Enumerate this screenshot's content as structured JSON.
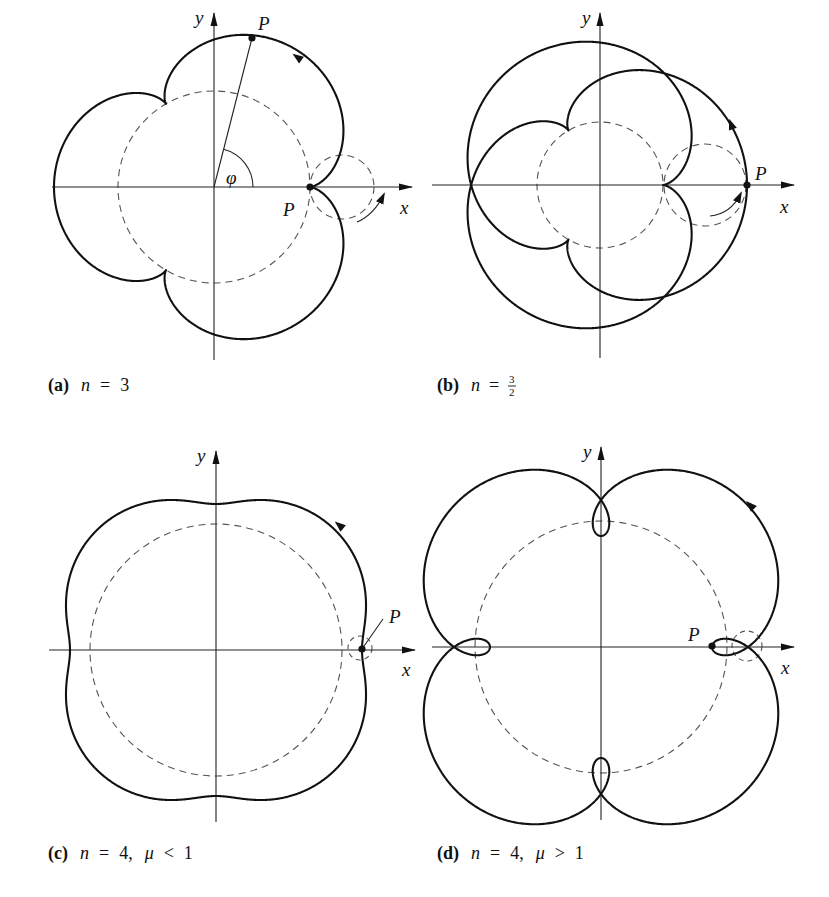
{
  "figure": {
    "width": 829,
    "height": 897,
    "colors": {
      "curve": "#111111",
      "axis": "#222222",
      "dashed": "#555555",
      "background": "#ffffff"
    }
  },
  "panels": [
    {
      "id": "a",
      "caption": {
        "tag": "(a)",
        "math": "n = 3",
        "n_label": "n",
        "eq": "=",
        "value": "3",
        "x": 48,
        "y": 391
      },
      "origin": [
        214,
        187
      ],
      "axes": {
        "x_from": 52,
        "x_to": 412,
        "y_from": 360,
        "y_to": 13,
        "x_label": "x",
        "y_label": "y",
        "x_label_pos": [
          400,
          214
        ],
        "y_label_pos": [
          195,
          24
        ]
      },
      "curve": {
        "type": "epicycloid",
        "R": 96,
        "r": 32,
        "d": 32,
        "turns": 1
      },
      "base_circle": {
        "r": 96
      },
      "rolling_circle": {
        "cx": 342,
        "cy": 187,
        "r": 32
      },
      "points": [
        {
          "label": "P",
          "x": 252,
          "y": 38,
          "label_pos": [
            258,
            30
          ]
        },
        {
          "label": "P",
          "x": 310,
          "y": 187,
          "label_pos": [
            283,
            216
          ]
        }
      ],
      "radius_line": {
        "from": [
          214,
          187
        ],
        "to": [
          252,
          38
        ]
      },
      "angle": {
        "label": "φ",
        "r": 39,
        "label_pos": [
          226,
          184
        ]
      },
      "direction_arrow": {
        "x": 297,
        "y": 57,
        "angle_deg": 215
      },
      "curved_arrow": {
        "from": [
          357,
          222
        ],
        "ctrl": [
          374,
          215
        ],
        "to": [
          384,
          194
        ]
      }
    },
    {
      "id": "b",
      "caption": {
        "tag": "(b)",
        "math": "n = 3/2",
        "n_label": "n",
        "eq": "=",
        "num": "3",
        "den": "2",
        "x": 437,
        "y": 391
      },
      "origin": [
        600,
        185
      ],
      "axes": {
        "x_from": 432,
        "x_to": 794,
        "y_from": 358,
        "y_to": 13,
        "x_label": "x",
        "y_label": "y",
        "x_label_pos": [
          780,
          213
        ],
        "y_label_pos": [
          582,
          24
        ]
      },
      "curve": {
        "type": "epicycloid",
        "R": 63,
        "r": 42,
        "d": 42,
        "turns": 2
      },
      "base_circle": {
        "r": 63
      },
      "rolling_circle": {
        "cx": 705,
        "cy": 185,
        "r": 41
      },
      "points": [
        {
          "label": "P",
          "x": 747,
          "y": 185,
          "label_pos": [
            755,
            180
          ]
        }
      ],
      "direction_arrow": {
        "x": 731,
        "y": 124,
        "angle_deg": 250
      },
      "curved_arrow": {
        "from": [
          710,
          216
        ],
        "ctrl": [
          731,
          214
        ],
        "to": [
          741,
          193
        ]
      }
    },
    {
      "id": "c",
      "caption": {
        "tag": "(c)",
        "math": "n = 4, μ < 1",
        "n_label": "n",
        "eq": "=",
        "value": "4,",
        "mu": "μ",
        "rel": "<",
        "rhs": "1",
        "x": 48,
        "y": 859
      },
      "origin": [
        216,
        650
      ],
      "axes": {
        "x_from": 49,
        "x_to": 415,
        "y_from": 822,
        "y_to": 451,
        "x_label": "x",
        "y_label": "y",
        "x_label_pos": [
          402,
          676
        ],
        "y_label_pos": [
          197,
          462
        ]
      },
      "curve": {
        "type": "epitrochoid",
        "R": 126,
        "r": 31.5,
        "d": 11.5,
        "turns": 1
      },
      "base_circle": {
        "r": 126
      },
      "rolling_circle": {
        "cx": 360,
        "cy": 648,
        "r": 12
      },
      "points": [
        {
          "label": "P",
          "x": 362,
          "y": 649,
          "label_pos": [
            389,
            623
          ]
        }
      ],
      "leader_line": {
        "from": [
          362,
          649
        ],
        "to": [
          383,
          619
        ]
      },
      "direction_arrow": {
        "x": 339,
        "y": 525,
        "angle_deg": 220
      }
    },
    {
      "id": "d",
      "caption": {
        "tag": "(d)",
        "math": "n = 4, μ > 1",
        "n_label": "n",
        "eq": "=",
        "value": "4,",
        "mu": "μ",
        "rel": ">",
        "rhs": "1",
        "x": 437,
        "y": 859
      },
      "origin": [
        601,
        647
      ],
      "axes": {
        "x_from": 432,
        "x_to": 794,
        "y_from": 820,
        "y_to": 447,
        "x_label": "x",
        "y_label": "y",
        "x_label_pos": [
          781,
          674
        ],
        "y_label_pos": [
          583,
          458
        ]
      },
      "curve": {
        "type": "epitrochoid",
        "R": 126,
        "r": 31.5,
        "d": 46.5,
        "turns": 1
      },
      "base_circle": {
        "r": 126
      },
      "rolling_circle": {
        "cx": 747,
        "cy": 646,
        "r": 15
      },
      "points": [
        {
          "label": "P",
          "x": 712,
          "y": 646,
          "label_pos": [
            688,
            641
          ]
        }
      ],
      "direction_arrow": {
        "x": 750,
        "y": 505,
        "angle_deg": 225
      }
    }
  ]
}
